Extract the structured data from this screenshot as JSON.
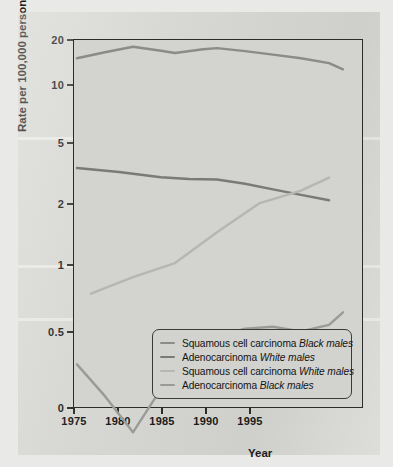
{
  "figure": {
    "background_color": "#d6d6d2",
    "plot_background_color": "#d3d3cf",
    "frame_color": "#2c2c2c"
  },
  "axes": {
    "y_title": "Rate per 100,000 person years",
    "x_title": "Year",
    "y_ticks": [
      "20",
      "10",
      "5",
      "2",
      "1",
      "0.5",
      "0"
    ],
    "x_ticks": [
      "1975",
      "1980",
      "1985",
      "1990",
      "1995"
    ]
  },
  "legend": {
    "items": [
      {
        "label_main": "Squamous cell carcinoma ",
        "label_em": "Black males",
        "color": "#8b8b87"
      },
      {
        "label_main": "Adenocarcinoma ",
        "label_em": "White males",
        "color": "#7a7a76"
      },
      {
        "label_main": "Squamous cell carcinoma ",
        "label_em": "White males",
        "color": "#b6b6b2"
      },
      {
        "label_main": "Adenocarcinoma ",
        "label_em": "Black males",
        "color": "#9a9a96"
      }
    ]
  },
  "chart_data": {
    "type": "line",
    "title": "",
    "xlabel": "Year",
    "ylabel": "Rate per 100,000 person years",
    "yscale": "log",
    "xlim": [
      1975,
      1995
    ],
    "ylim": [
      0.18,
      20
    ],
    "ytick_values": [
      20,
      10,
      5,
      2,
      1,
      0.5,
      0
    ],
    "ytick_labels": [
      "20",
      "10",
      "5",
      "2",
      "1",
      "0.5",
      "0"
    ],
    "xtick_values": [
      1975,
      1980,
      1985,
      1990,
      1995
    ],
    "xtick_labels": [
      "1975",
      "1980",
      "1985",
      "1990",
      "1995"
    ],
    "grid": false,
    "legend_position": "lower right",
    "series": [
      {
        "name": "Squamous cell carcinoma Black males",
        "color": "#8b8b87",
        "x": [
          1975,
          1977,
          1979,
          1981,
          1982,
          1984,
          1985,
          1987,
          1989,
          1991,
          1993,
          1994
        ],
        "y": [
          15.3,
          16.8,
          18.3,
          17.2,
          16.6,
          17.6,
          17.9,
          17.1,
          16.2,
          15.3,
          14.2,
          12.9
        ]
      },
      {
        "name": "Adenocarcinoma White males",
        "color": "#7a7a76",
        "x": [
          1975,
          1978,
          1981,
          1983,
          1985,
          1987,
          1989,
          1991,
          1993
        ],
        "y": [
          3.45,
          3.25,
          3.0,
          2.92,
          2.9,
          2.72,
          2.5,
          2.3,
          2.12
        ]
      },
      {
        "name": "Squamous cell carcinoma White males",
        "color": "#b6b6b2",
        "x": [
          1976,
          1979,
          1982,
          1985,
          1988,
          1991,
          1993
        ],
        "y": [
          0.74,
          0.88,
          1.02,
          1.45,
          2.02,
          2.45,
          2.98
        ]
      },
      {
        "name": "Adenocarcinoma Black males",
        "color": "#9a9a96",
        "x": [
          1975,
          1977,
          1979,
          1981,
          1983,
          1985,
          1987,
          1989,
          1991,
          1993,
          1994
        ],
        "y": [
          0.355,
          0.255,
          0.175,
          0.275,
          0.375,
          0.475,
          0.515,
          0.525,
          0.5,
          0.535,
          0.61
        ]
      }
    ]
  }
}
